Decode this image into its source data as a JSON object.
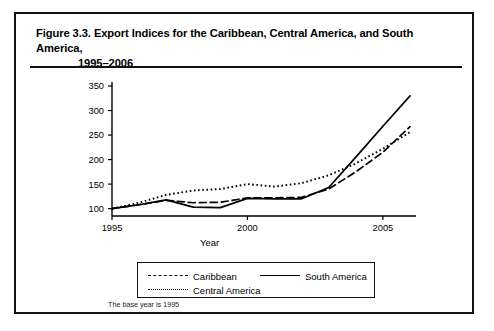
{
  "figure": {
    "number": "Figure 3.3.",
    "title_line1": "Export Indices for the Caribbean, Central America, and South America,",
    "title_line2": "1995–2006",
    "note": "The base year is 1995"
  },
  "axes": {
    "xlabel": "Year",
    "ylabel": "",
    "x_ticks": [
      "1995",
      "2000",
      "2005"
    ],
    "y_ticks": [
      "100",
      "150",
      "200",
      "250",
      "300",
      "350"
    ]
  },
  "legend": {
    "items": [
      {
        "label": "Caribbean",
        "style": "dashed"
      },
      {
        "label": "South America",
        "style": "solid"
      },
      {
        "label": "Central America",
        "style": "dotted"
      }
    ]
  },
  "chart_data": {
    "type": "line",
    "title": "Export Indices for the Caribbean, Central America, and South America, 1995–2006",
    "xlabel": "Year",
    "ylabel": "",
    "xlim": [
      1995,
      2006
    ],
    "ylim": [
      85,
      350
    ],
    "grid": false,
    "legend_position": "bottom",
    "annotations": [
      "The base year is 1995"
    ],
    "x": [
      1995,
      1996,
      1997,
      1998,
      1999,
      2000,
      2001,
      2002,
      2003,
      2004,
      2005,
      2006
    ],
    "series": [
      {
        "name": "Caribbean",
        "style": "dashed",
        "color": "#000000",
        "values": [
          100,
          108,
          117,
          112,
          113,
          122,
          122,
          123,
          140,
          175,
          215,
          267
        ]
      },
      {
        "name": "Central America",
        "style": "dotted",
        "color": "#000000",
        "values": [
          100,
          112,
          128,
          137,
          140,
          150,
          145,
          152,
          168,
          192,
          222,
          256
        ]
      },
      {
        "name": "South America",
        "style": "solid",
        "color": "#000000",
        "values": [
          100,
          108,
          118,
          103,
          102,
          121,
          120,
          120,
          143,
          205,
          268,
          330
        ]
      }
    ]
  },
  "colors": {
    "ink": "#000000",
    "frame": "#111111",
    "background": "#ffffff"
  }
}
